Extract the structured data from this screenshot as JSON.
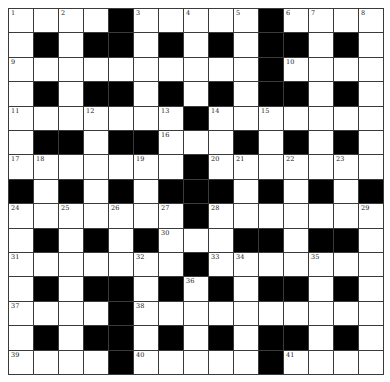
{
  "puzzle": {
    "size": 15,
    "rows": [
      "1.2.#3.4.5#67.8",
      ".#.##.#.#.##.#.",
      "9.........#10...",
      ".#.##.#.#.##.#.",
      "",
      "",
      "",
      "",
      "",
      "",
      "",
      "",
      "",
      "",
      ""
    ],
    "grid": [
      [
        ".",
        ".",
        ".",
        ".",
        "#",
        ".",
        ".",
        ".",
        ".",
        ".",
        "#",
        ".",
        ".",
        ".",
        "."
      ],
      [
        ".",
        "#",
        ".",
        "#",
        "#",
        ".",
        "#",
        ".",
        "#",
        ".",
        "#",
        "#",
        ".",
        "#",
        "."
      ],
      [
        ".",
        ".",
        ".",
        ".",
        ".",
        ".",
        ".",
        ".",
        ".",
        ".",
        "#",
        ".",
        ".",
        ".",
        "."
      ],
      [
        ".",
        "#",
        ".",
        "#",
        "#",
        ".",
        "#",
        ".",
        "#",
        ".",
        "#",
        "#",
        ".",
        "#",
        "."
      ],
      [
        ".",
        ".",
        ".",
        ".",
        ".",
        ".",
        ".",
        "#",
        ".",
        ".",
        ".",
        ".",
        ".",
        ".",
        "."
      ],
      [
        ".",
        "#",
        "#",
        ".",
        "#",
        "#",
        ".",
        ".",
        ".",
        "#",
        ".",
        "#",
        ".",
        "#",
        "."
      ],
      [
        ".",
        ".",
        ".",
        ".",
        ".",
        ".",
        ".",
        "#",
        ".",
        ".",
        ".",
        ".",
        ".",
        ".",
        "."
      ],
      [
        "#",
        ".",
        "#",
        ".",
        "#",
        ".",
        "#",
        "#",
        "#",
        ".",
        "#",
        ".",
        "#",
        ".",
        "#"
      ],
      [
        ".",
        ".",
        ".",
        ".",
        ".",
        ".",
        ".",
        "#",
        ".",
        ".",
        ".",
        ".",
        ".",
        ".",
        "."
      ],
      [
        ".",
        "#",
        ".",
        "#",
        ".",
        "#",
        ".",
        ".",
        ".",
        "#",
        "#",
        ".",
        "#",
        "#",
        "."
      ],
      [
        ".",
        ".",
        ".",
        ".",
        ".",
        ".",
        ".",
        "#",
        ".",
        ".",
        ".",
        ".",
        ".",
        ".",
        "."
      ],
      [
        ".",
        "#",
        ".",
        "#",
        "#",
        ".",
        "#",
        ".",
        "#",
        ".",
        "#",
        "#",
        ".",
        "#",
        "."
      ],
      [
        ".",
        ".",
        ".",
        ".",
        "#",
        ".",
        ".",
        ".",
        ".",
        ".",
        ".",
        ".",
        ".",
        ".",
        "."
      ],
      [
        ".",
        "#",
        ".",
        "#",
        "#",
        ".",
        "#",
        ".",
        "#",
        ".",
        "#",
        "#",
        ".",
        "#",
        "."
      ],
      [
        ".",
        ".",
        ".",
        ".",
        "#",
        ".",
        ".",
        ".",
        ".",
        ".",
        "#",
        ".",
        ".",
        ".",
        "."
      ]
    ],
    "numbers": [
      {
        "r": 0,
        "c": 0,
        "n": "1"
      },
      {
        "r": 0,
        "c": 2,
        "n": "2"
      },
      {
        "r": 0,
        "c": 5,
        "n": "3"
      },
      {
        "r": 0,
        "c": 7,
        "n": "4"
      },
      {
        "r": 0,
        "c": 9,
        "n": "5"
      },
      {
        "r": 0,
        "c": 11,
        "n": "6"
      },
      {
        "r": 0,
        "c": 12,
        "n": "7"
      },
      {
        "r": 0,
        "c": 14,
        "n": "8"
      },
      {
        "r": 2,
        "c": 0,
        "n": "9"
      },
      {
        "r": 2,
        "c": 11,
        "n": "10"
      },
      {
        "r": 4,
        "c": 0,
        "n": "11"
      },
      {
        "r": 4,
        "c": 3,
        "n": "12"
      },
      {
        "r": 4,
        "c": 6,
        "n": "13"
      },
      {
        "r": 4,
        "c": 8,
        "n": "14"
      },
      {
        "r": 4,
        "c": 10,
        "n": "15"
      },
      {
        "r": 5,
        "c": 6,
        "n": "16"
      },
      {
        "r": 6,
        "c": 0,
        "n": "17"
      },
      {
        "r": 6,
        "c": 1,
        "n": "18"
      },
      {
        "r": 6,
        "c": 5,
        "n": "19"
      },
      {
        "r": 6,
        "c": 8,
        "n": "20"
      },
      {
        "r": 6,
        "c": 9,
        "n": "21"
      },
      {
        "r": 6,
        "c": 11,
        "n": "22"
      },
      {
        "r": 6,
        "c": 13,
        "n": "23"
      },
      {
        "r": 8,
        "c": 0,
        "n": "24"
      },
      {
        "r": 8,
        "c": 2,
        "n": "25"
      },
      {
        "r": 8,
        "c": 4,
        "n": "26"
      },
      {
        "r": 8,
        "c": 6,
        "n": "27"
      },
      {
        "r": 8,
        "c": 8,
        "n": "28"
      },
      {
        "r": 8,
        "c": 14,
        "n": "29"
      },
      {
        "r": 9,
        "c": 6,
        "n": "30"
      },
      {
        "r": 10,
        "c": 0,
        "n": "31"
      },
      {
        "r": 10,
        "c": 5,
        "n": "32"
      },
      {
        "r": 10,
        "c": 8,
        "n": "33"
      },
      {
        "r": 10,
        "c": 9,
        "n": "34"
      },
      {
        "r": 10,
        "c": 12,
        "n": "35"
      },
      {
        "r": 11,
        "c": 7,
        "n": "36"
      },
      {
        "r": 12,
        "c": 0,
        "n": "37"
      },
      {
        "r": 12,
        "c": 5,
        "n": "38"
      },
      {
        "r": 14,
        "c": 0,
        "n": "39"
      },
      {
        "r": 14,
        "c": 5,
        "n": "40"
      },
      {
        "r": 14,
        "c": 11,
        "n": "41"
      }
    ]
  },
  "colors": {
    "block": "#000000",
    "cell": "#ffffff",
    "gridline": "#3a3a3a"
  }
}
